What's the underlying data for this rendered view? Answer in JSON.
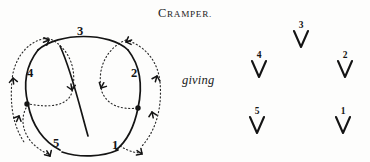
{
  "plate": {
    "title": "CRAMPER.",
    "title_first_letter": "C",
    "title_rest": "RAMPER.",
    "connector_word": "giving"
  },
  "ring_diagram": {
    "name": "cramper-ring-diagram",
    "description": "Circular change-ringing position diagram with crossing solid and dotted arrowed paths",
    "position_labels": [
      "1",
      "2",
      "3",
      "4",
      "5"
    ],
    "labels": [
      {
        "text": "3",
        "x": 78,
        "y": 14
      },
      {
        "text": "4",
        "x": 28,
        "y": 56
      },
      {
        "text": "2",
        "x": 130,
        "y": 56
      },
      {
        "text": "5",
        "x": 52,
        "y": 126
      },
      {
        "text": "1",
        "x": 112,
        "y": 128
      }
    ],
    "dots": [
      {
        "x": 25,
        "y": 88
      },
      {
        "x": 136,
        "y": 92
      }
    ],
    "stroke_color": "#141414",
    "dotted_color": "#2a2a2a"
  },
  "result_marks": {
    "name": "resulting-order-marks",
    "glyph": "down-chevron-arrow",
    "items": [
      {
        "number": "3",
        "x": 56,
        "y": 2
      },
      {
        "number": "4",
        "x": 14,
        "y": 32
      },
      {
        "number": "2",
        "x": 100,
        "y": 32
      },
      {
        "number": "5",
        "x": 12,
        "y": 88
      },
      {
        "number": "1",
        "x": 98,
        "y": 88
      }
    ]
  },
  "colors": {
    "ink": "#141414",
    "paper": "#fdfdfc"
  }
}
